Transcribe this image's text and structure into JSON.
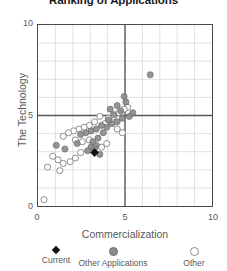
{
  "chart_data": {
    "type": "scatter",
    "title": "Ranking of Applications",
    "xlabel": "Commercialization",
    "ylabel": "The Technology",
    "xlim": [
      0,
      10
    ],
    "ylim": [
      0,
      10
    ],
    "xticks": [
      0,
      5,
      10
    ],
    "yticks": [
      0,
      5,
      10
    ],
    "xtick_labels": [
      "0",
      "5",
      "10"
    ],
    "ytick_labels": [
      "0",
      "5",
      "10"
    ],
    "grid": true,
    "grid_step": 1,
    "quadrant_lines": {
      "x": 5,
      "y": 5,
      "color": "#595959"
    },
    "legend_position": "bottom",
    "series": [
      {
        "name": "Current",
        "marker": "filled-diamond",
        "color": "#111111",
        "points": [
          [
            3.25,
            2.95
          ]
        ]
      },
      {
        "name": "Other Applications",
        "marker": "filled-circle",
        "color": "#8c8c8c",
        "points": [
          [
            6.45,
            7.25
          ],
          [
            5.45,
            5.15
          ],
          [
            4.95,
            6.05
          ],
          [
            4.55,
            5.55
          ],
          [
            4.75,
            5.25
          ],
          [
            4.35,
            5.05
          ],
          [
            4.85,
            4.85
          ],
          [
            4.55,
            4.65
          ],
          [
            4.25,
            4.55
          ],
          [
            3.95,
            4.35
          ],
          [
            3.65,
            4.45
          ],
          [
            3.35,
            4.25
          ],
          [
            3.05,
            4.15
          ],
          [
            2.75,
            4.05
          ],
          [
            2.45,
            3.95
          ],
          [
            3.45,
            3.75
          ],
          [
            3.15,
            3.55
          ],
          [
            3.35,
            3.35
          ],
          [
            3.05,
            3.25
          ],
          [
            3.25,
            3.15
          ],
          [
            3.55,
            2.85
          ],
          [
            2.85,
            3.05
          ],
          [
            1.55,
            3.15
          ],
          [
            1.05,
            3.35
          ],
          [
            5.05,
            5.75
          ],
          [
            5.25,
            4.95
          ],
          [
            4.15,
            5.35
          ],
          [
            2.25,
            3.45
          ],
          [
            4.05,
            4.75
          ],
          [
            3.75,
            4.05
          ]
        ]
      },
      {
        "name": "Other",
        "marker": "open-circle",
        "color": "#8c8c8c",
        "points": [
          [
            5.15,
            5.45
          ],
          [
            4.95,
            5.35
          ],
          [
            4.65,
            5.15
          ],
          [
            4.35,
            4.95
          ],
          [
            4.05,
            4.85
          ],
          [
            3.85,
            4.55
          ],
          [
            3.55,
            4.95
          ],
          [
            3.25,
            4.65
          ],
          [
            2.95,
            4.45
          ],
          [
            2.65,
            4.35
          ],
          [
            2.35,
            4.25
          ],
          [
            2.05,
            4.15
          ],
          [
            1.75,
            4.05
          ],
          [
            1.45,
            3.85
          ],
          [
            2.15,
            3.65
          ],
          [
            2.55,
            3.55
          ],
          [
            2.95,
            3.65
          ],
          [
            3.95,
            3.45
          ],
          [
            3.65,
            3.25
          ],
          [
            2.45,
            2.95
          ],
          [
            2.15,
            2.65
          ],
          [
            1.85,
            2.45
          ],
          [
            1.45,
            2.35
          ],
          [
            1.15,
            2.55
          ],
          [
            0.85,
            2.75
          ],
          [
            1.25,
            1.95
          ],
          [
            0.55,
            2.15
          ],
          [
            0.35,
            0.35
          ],
          [
            4.55,
            4.25
          ],
          [
            4.85,
            4.05
          ]
        ]
      }
    ]
  },
  "legend": {
    "items": [
      {
        "label": "Current",
        "marker": "filled-diamond"
      },
      {
        "label": "Other Applications",
        "marker": "filled-circle"
      },
      {
        "label": "Other",
        "marker": "open-circle"
      }
    ]
  }
}
